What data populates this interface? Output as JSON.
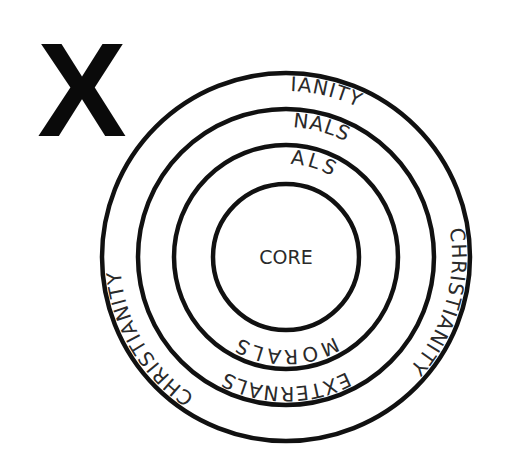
{
  "diagram": {
    "type": "concentric-circles",
    "marker": "X",
    "center": "CORE",
    "rings": [
      {
        "name": "core",
        "label": "CORE",
        "radius": 73
      },
      {
        "name": "morals",
        "label": "MORALS",
        "radius": 112
      },
      {
        "name": "externals",
        "label": "EXTERNALS",
        "radius": 148
      },
      {
        "name": "christianity",
        "label": "CHRISTIANITY",
        "radius": 184
      }
    ],
    "labels": {
      "core": "CORE",
      "morals_top": "MORALS",
      "morals_bottom": "MORALS",
      "externals_top": "EXTERNALS",
      "externals_bottom": "EXTERNALS",
      "christianity_top": "CHRISTIANITY",
      "christianity_left": "CHRISTIANITY",
      "christianity_right": "CHRISTIANITY"
    },
    "colors": {
      "stroke": "#111111",
      "text": "#2a2a2a",
      "background": "#ffffff"
    }
  }
}
